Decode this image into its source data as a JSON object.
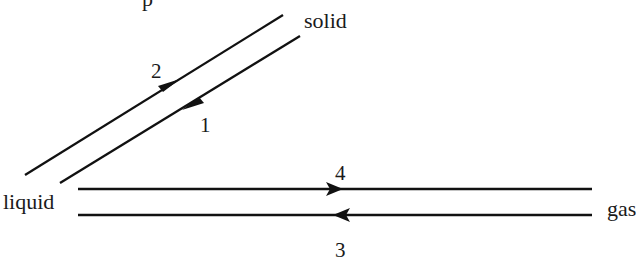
{
  "diagram": {
    "top_fragment": "p",
    "nodes": {
      "solid": "solid",
      "liquid": "liquid",
      "gas": "gas"
    },
    "arrows": [
      {
        "id": "1",
        "label": "1",
        "from": "solid",
        "to": "liquid"
      },
      {
        "id": "2",
        "label": "2",
        "from": "liquid",
        "to": "solid"
      },
      {
        "id": "3",
        "label": "3",
        "from": "gas",
        "to": "liquid"
      },
      {
        "id": "4",
        "label": "4",
        "from": "liquid",
        "to": "gas"
      }
    ],
    "colors": {
      "line": "#111111",
      "text": "#1a1a1a",
      "background": "#ffffff"
    }
  }
}
